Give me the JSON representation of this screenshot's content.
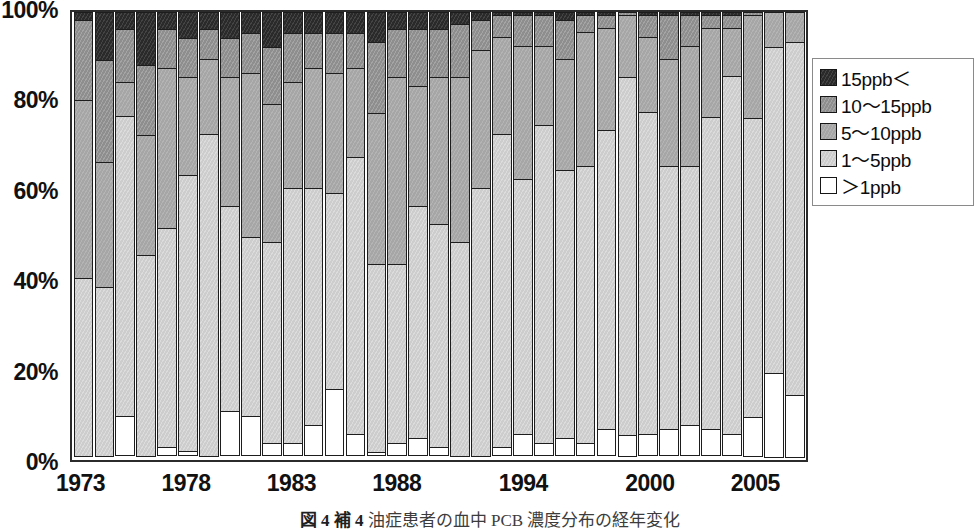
{
  "caption": {
    "number": "図 4 補 4",
    "text": "油症患者の血中 PCB 濃度分布の経年変化"
  },
  "legend": {
    "position": "right",
    "items": [
      {
        "label": "15ppb＜",
        "color": "#2a2a2a",
        "key": "gt15"
      },
      {
        "label": "10〜15ppb",
        "color": "#8e8e8e",
        "key": "r10_15"
      },
      {
        "label": "5〜10ppb",
        "color": "#a6a6a6",
        "key": "r5_10"
      },
      {
        "label": "1〜5ppb",
        "color": "#cdcdcd",
        "key": "r1_5"
      },
      {
        "label": "＞1ppb",
        "color": "#ffffff",
        "key": "lt1"
      }
    ]
  },
  "axes": {
    "y_ticks": [
      "100%",
      "80%",
      "60%",
      "40%",
      "20%",
      "0%"
    ],
    "y_tick_values": [
      100,
      80,
      60,
      40,
      20,
      0
    ],
    "x_ticks": [
      "1973",
      "1978",
      "1983",
      "1988",
      "1994",
      "2000",
      "2005"
    ],
    "x_tick_index": [
      0,
      5,
      10,
      15,
      21,
      27,
      32
    ]
  },
  "chart_data": {
    "type": "bar",
    "subtype": "stacked-100-percent",
    "title": "油症患者の血中 PCB 濃度分布の経年変化",
    "xlabel": "",
    "ylabel": "",
    "ylim": [
      0,
      100
    ],
    "grid": false,
    "legend_position": "right",
    "stack_order_bottom_to_top": [
      "＞1ppb",
      "1〜5ppb",
      "5〜10ppb",
      "10〜15ppb",
      "15ppb＜"
    ],
    "categories": [
      "1973",
      "1974",
      "1975",
      "1976",
      "1977",
      "1978",
      "1979",
      "1980",
      "1981",
      "1982",
      "1983",
      "1984",
      "1985",
      "1986",
      "1987",
      "1988",
      "1989",
      "1990",
      "1991",
      "1992",
      "1993",
      "1994",
      "1995",
      "1996",
      "1997",
      "1998",
      "1999",
      "2000",
      "2001",
      "2002",
      "2003",
      "2004",
      "2005",
      "2006",
      "2007"
    ],
    "series": [
      {
        "name": "＞1ppb",
        "color": "#ffffff",
        "values": [
          0,
          0,
          9,
          0,
          2,
          1,
          0,
          10,
          9,
          3,
          3,
          7,
          15,
          5,
          1,
          3,
          4,
          2,
          0,
          0,
          2,
          5,
          3,
          4,
          3,
          6,
          5,
          5,
          6,
          7,
          6,
          5,
          9,
          19,
          14
        ]
      },
      {
        "name": "1〜5ppb",
        "color": "#cdcdcd",
        "values": [
          40,
          38,
          67,
          45,
          49,
          62,
          72,
          46,
          40,
          45,
          57,
          53,
          44,
          62,
          42,
          40,
          52,
          50,
          48,
          60,
          70,
          57,
          71,
          60,
          62,
          67,
          80,
          72,
          59,
          58,
          70,
          80,
          67,
          73,
          79
        ]
      },
      {
        "name": "5〜10ppb",
        "color": "#a6a6a6",
        "values": [
          40,
          28,
          8,
          27,
          36,
          22,
          17,
          29,
          37,
          31,
          24,
          27,
          27,
          20,
          34,
          42,
          27,
          33,
          37,
          31,
          22,
          30,
          18,
          25,
          30,
          23,
          14,
          17,
          24,
          27,
          20,
          11,
          23,
          8,
          7
        ]
      },
      {
        "name": "10〜15ppb",
        "color": "#8e8e8e",
        "values": [
          18,
          23,
          12,
          16,
          9,
          9,
          7,
          9,
          9,
          13,
          11,
          8,
          9,
          8,
          16,
          11,
          13,
          11,
          12,
          7,
          5,
          7,
          7,
          9,
          4,
          3,
          1,
          5,
          10,
          7,
          3,
          3,
          1,
          0,
          0
        ]
      },
      {
        "name": "15ppb＜",
        "color": "#2a2a2a",
        "values": [
          2,
          11,
          4,
          12,
          4,
          6,
          4,
          6,
          5,
          8,
          5,
          5,
          5,
          5,
          7,
          4,
          4,
          4,
          3,
          2,
          1,
          1,
          1,
          2,
          1,
          1,
          0,
          1,
          1,
          1,
          1,
          1,
          0,
          0,
          0
        ]
      }
    ]
  }
}
